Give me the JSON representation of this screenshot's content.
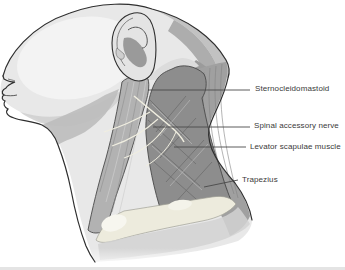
{
  "diagram": {
    "labels": [
      {
        "id": "sternocleidomastoid",
        "text": "Sternocleidomastoid"
      },
      {
        "id": "spinal-accessory-nerve",
        "text": "Spinal accessory nerve"
      },
      {
        "id": "levator-scapulae",
        "text": "Levator scapulae muscle"
      },
      {
        "id": "trapezius",
        "text": "Trapezius"
      }
    ],
    "colors": {
      "outline": "#2f2f2f",
      "leader_line": "#4a4a4a",
      "label_text": "#3a3a3a",
      "skin": "#e8e8e8",
      "skin_highlight": "#f3f3f3",
      "skin_shadow": "#bdbdbd",
      "hair": "#c2c2c2",
      "scm_muscle": "#b2b2b2",
      "levator_muscle": "#8d8d8d",
      "trapezius_muscle": "#a0a0a0",
      "nerve": "#f0eee0",
      "clavicle_bone": "#edebdd",
      "chest_shadow": "#d2d2d2"
    }
  }
}
